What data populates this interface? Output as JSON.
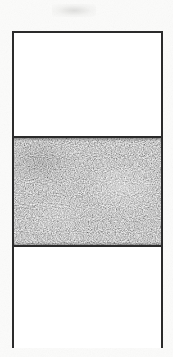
{
  "figure": {
    "background_color": "#fbfbfa",
    "canvas_width": 173,
    "canvas_height": 357,
    "caption": "",
    "artifacts": {
      "top_smudge_label": "faint scan smudge",
      "paper_grain_label": "paper grain speckle"
    }
  },
  "specimen_box": {
    "label": "bordered specimen column",
    "border_color": "#2b2b2b",
    "border_width_px": 2,
    "fill_color": "#ffffff",
    "left_px": 12,
    "top_px": 31,
    "width_px": 151,
    "height_px": 317
  },
  "bands": [
    {
      "id": "band-top",
      "name": "upper clear band",
      "fill": "clear",
      "fill_color": "#ffffff",
      "height_px": 103,
      "top_px": 33,
      "bottom_px": 136,
      "texture": "none",
      "annotation": ""
    },
    {
      "id": "band-middle",
      "name": "shaded textured band",
      "fill": "stipple-texture",
      "fill_color": "#9a9a9a",
      "height_px": 111,
      "top_px": 136,
      "bottom_px": 247,
      "texture": "random-gray-noise",
      "texture_min_gray": 96,
      "texture_max_gray": 206,
      "texture_mean_gray": 152,
      "divider_color": "#2b2b2b",
      "divider_width_px": 2,
      "annotation": ""
    },
    {
      "id": "band-bottom",
      "name": "lower clear band",
      "fill": "clear",
      "fill_color": "#ffffff",
      "height_px": 101,
      "top_px": 247,
      "bottom_px": 348,
      "texture": "none",
      "annotation": ""
    }
  ]
}
